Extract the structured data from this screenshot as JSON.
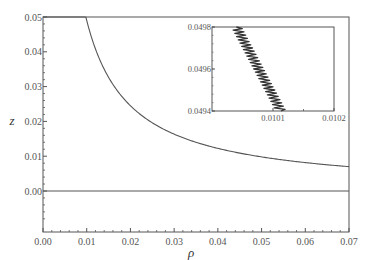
{
  "chart_data": [
    {
      "type": "line",
      "role": "main",
      "title": "",
      "xlabel": "ρ",
      "ylabel": "z",
      "xlim": [
        0.0,
        0.07
      ],
      "ylim": [
        -0.012,
        0.05
      ],
      "xticks": [
        "0.00",
        "0.01",
        "0.02",
        "0.03",
        "0.04",
        "0.05",
        "0.06",
        "0.07"
      ],
      "yticks": [
        "0.00",
        "0.01",
        "0.02",
        "0.03",
        "0.04",
        "0.05"
      ],
      "grid": false,
      "legend": null,
      "series": [
        {
          "name": "curve",
          "x": [
            0.0098,
            0.011,
            0.0125,
            0.015,
            0.0175,
            0.02,
            0.025,
            0.03,
            0.035,
            0.04,
            0.045,
            0.05,
            0.055,
            0.06,
            0.065,
            0.07
          ],
          "y": [
            0.05,
            0.0455,
            0.04,
            0.0333,
            0.0286,
            0.025,
            0.02,
            0.0167,
            0.0143,
            0.0125,
            0.0111,
            0.01,
            0.0091,
            0.0083,
            0.0077,
            0.0072
          ]
        },
        {
          "name": "baseline z=0",
          "x": [
            0.0,
            0.07
          ],
          "y": [
            0.0,
            0.0
          ]
        },
        {
          "name": "top line z=0.05",
          "x": [
            0.0,
            0.0098
          ],
          "y": [
            0.05,
            0.05
          ]
        }
      ]
    },
    {
      "type": "line",
      "role": "inset",
      "title": "",
      "xlabel": "",
      "ylabel": "",
      "xlim": [
        0.01,
        0.0102
      ],
      "ylim": [
        0.0494,
        0.0498
      ],
      "xticks": [
        "0.0101",
        "0.0102"
      ],
      "yticks": [
        "0.0494",
        "0.0496",
        "0.0498"
      ],
      "grid": false,
      "series": [
        {
          "name": "oscillating curve (zoomed)",
          "x_start": 0.01004,
          "y_start": 0.0498,
          "x_end": 0.010113,
          "y_end": 0.0494,
          "oscillations": 26,
          "amplitude_x": 6.5e-06
        }
      ]
    }
  ],
  "colors": {
    "axis": "#555555",
    "curve": "#555555",
    "inset_curve": "#333333",
    "background": "#ffffff"
  }
}
